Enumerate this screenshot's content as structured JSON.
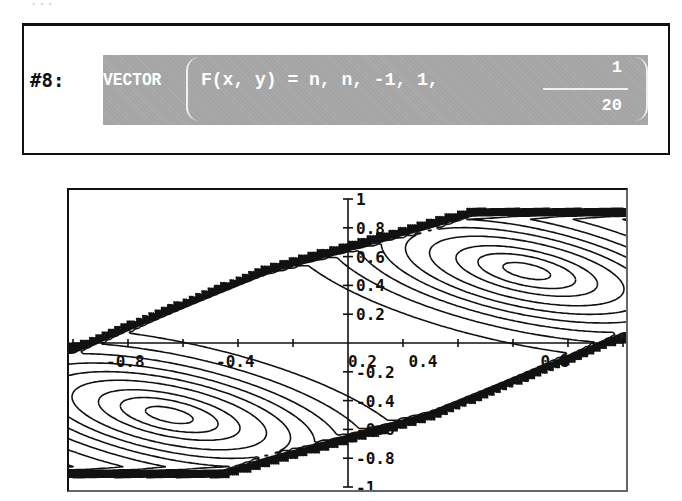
{
  "top_caption_fragment": "...",
  "expression": {
    "label": "#8:",
    "function_name": "VECTOR",
    "args_text": "F(x, y) = n, n, -1, 1,",
    "step_fraction": {
      "numerator": "1",
      "denominator": "20"
    },
    "highlight_color": "#a4a4a4",
    "text_color": "#ffffff"
  },
  "chart_data": {
    "type": "contour",
    "title": "",
    "xlabel": "",
    "ylabel": "",
    "xlim": [
      -1,
      1
    ],
    "ylim": [
      -1,
      1
    ],
    "x_tick_labels": [
      "-0.8",
      "-0.4",
      "0.2",
      "0.4",
      "0.8"
    ],
    "y_tick_labels": [
      "1",
      "0.8",
      "0.6",
      "0.4",
      "0.2",
      "-0.2",
      "-0.4",
      "-0.6",
      "-0.8",
      "-1"
    ],
    "grid": false,
    "centers": [
      {
        "x": 0.65,
        "y": 0.5
      },
      {
        "x": -0.65,
        "y": -0.5
      }
    ],
    "band": {
      "upper_edge": [
        [
          -1.0,
          0.0
        ],
        [
          -0.3,
          0.55
        ],
        [
          0.45,
          0.95
        ],
        [
          1.0,
          0.95
        ]
      ],
      "lower_edge": [
        [
          -1.0,
          -0.95
        ],
        [
          -0.45,
          -0.95
        ],
        [
          0.3,
          -0.55
        ],
        [
          1.0,
          0.0
        ]
      ]
    },
    "line_color": "#111111"
  }
}
